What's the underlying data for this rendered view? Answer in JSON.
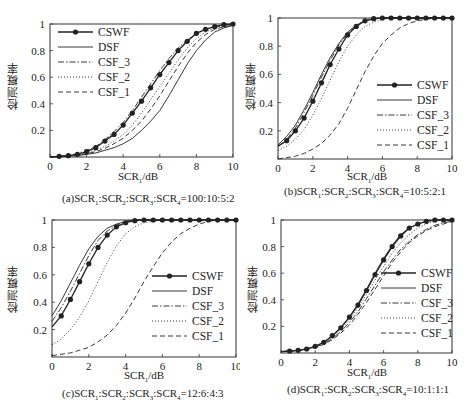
{
  "figure": {
    "ylabel": "检测概率",
    "xlabel_main": "SCR",
    "xlabel_sub": "1",
    "xlabel_unit": "/dB"
  },
  "legend": [
    "CSWF",
    "DSF",
    "CSF_3",
    "CSF_2",
    "CSF_1"
  ],
  "colors": {
    "line": "#222222",
    "axis": "#333333",
    "background": "#ffffff"
  },
  "chart_data": [
    {
      "type": "line",
      "id": "a",
      "caption": "(a)SCR1:SCR2:SCR3:SCR4=100:10:5:2",
      "caption_parts": [
        "(a)SCR",
        "1",
        ":SCR",
        "2",
        ":SCR",
        "3",
        ":SCR",
        "4",
        "=100:10:5:2"
      ],
      "xlabel": "SCR1/dB",
      "ylabel": "检测概率",
      "xlim": [
        0,
        10
      ],
      "ylim": [
        0,
        1
      ],
      "xticks": [
        0,
        2,
        4,
        6,
        8,
        10
      ],
      "yticks": [
        0.2,
        0.4,
        0.6,
        0.8,
        1
      ],
      "legend_position": "upper left",
      "x": [
        0,
        0.5,
        1,
        1.5,
        2,
        2.5,
        3,
        3.5,
        4,
        4.5,
        5,
        5.5,
        6,
        6.5,
        7,
        7.5,
        8,
        8.5,
        9,
        9.5,
        10
      ],
      "series": [
        {
          "name": "CSWF",
          "style": "solid-marker",
          "values": [
            0.0,
            0.005,
            0.01,
            0.02,
            0.04,
            0.07,
            0.12,
            0.17,
            0.24,
            0.33,
            0.42,
            0.52,
            0.62,
            0.71,
            0.8,
            0.87,
            0.93,
            0.96,
            0.98,
            0.995,
            1.0
          ]
        },
        {
          "name": "DSF",
          "style": "solid",
          "values": [
            0.0,
            0.003,
            0.006,
            0.01,
            0.02,
            0.03,
            0.05,
            0.07,
            0.1,
            0.14,
            0.2,
            0.27,
            0.35,
            0.46,
            0.58,
            0.7,
            0.8,
            0.88,
            0.94,
            0.97,
            0.99
          ]
        },
        {
          "name": "CSF_3",
          "style": "dashdot",
          "values": [
            0.0,
            0.006,
            0.012,
            0.025,
            0.05,
            0.08,
            0.13,
            0.19,
            0.26,
            0.35,
            0.45,
            0.55,
            0.65,
            0.74,
            0.82,
            0.88,
            0.93,
            0.96,
            0.98,
            0.99,
            1.0
          ]
        },
        {
          "name": "CSF_2",
          "style": "dotted",
          "values": [
            0.0,
            0.004,
            0.008,
            0.015,
            0.03,
            0.05,
            0.08,
            0.12,
            0.17,
            0.24,
            0.33,
            0.43,
            0.53,
            0.63,
            0.73,
            0.82,
            0.89,
            0.94,
            0.97,
            0.99,
            1.0
          ]
        },
        {
          "name": "CSF_1",
          "style": "dashed",
          "values": [
            0.0,
            0.004,
            0.007,
            0.012,
            0.025,
            0.04,
            0.065,
            0.1,
            0.14,
            0.2,
            0.27,
            0.36,
            0.46,
            0.57,
            0.68,
            0.78,
            0.86,
            0.92,
            0.96,
            0.98,
            0.99
          ]
        }
      ]
    },
    {
      "type": "line",
      "id": "b",
      "caption": "(b)SCR1:SCR2:SCR3:SCR4=10:5:2:1",
      "caption_parts": [
        "(b)SCR",
        "1",
        ":SCR",
        "2",
        ":SCR",
        "3",
        ":SCR",
        "4",
        "=10:5:2:1"
      ],
      "xlabel": "SCR1/dB",
      "ylabel": "检测概率",
      "xlim": [
        0,
        10
      ],
      "ylim": [
        0,
        1
      ],
      "xticks": [
        0,
        2,
        4,
        6,
        8,
        10
      ],
      "yticks": [
        0.2,
        0.4,
        0.6,
        0.8,
        1
      ],
      "legend_position": "lower right",
      "x": [
        0,
        0.5,
        1,
        1.5,
        2,
        2.5,
        3,
        3.5,
        4,
        4.5,
        5,
        5.5,
        6,
        6.5,
        7,
        7.5,
        8,
        8.5,
        9,
        9.5,
        10
      ],
      "series": [
        {
          "name": "CSWF",
          "style": "solid-marker",
          "values": [
            0.09,
            0.13,
            0.2,
            0.29,
            0.41,
            0.54,
            0.67,
            0.78,
            0.88,
            0.94,
            0.98,
            0.995,
            1.0,
            1.0,
            1.0,
            1.0,
            1.0,
            1.0,
            1.0,
            1.0,
            1.0
          ]
        },
        {
          "name": "DSF",
          "style": "solid",
          "values": [
            0.1,
            0.16,
            0.24,
            0.35,
            0.47,
            0.6,
            0.72,
            0.82,
            0.9,
            0.95,
            0.98,
            0.995,
            1.0,
            1.0,
            1.0,
            1.0,
            1.0,
            1.0,
            1.0,
            1.0,
            1.0
          ]
        },
        {
          "name": "CSF_3",
          "style": "dashdot",
          "values": [
            0.09,
            0.14,
            0.22,
            0.33,
            0.45,
            0.58,
            0.7,
            0.81,
            0.89,
            0.95,
            0.98,
            0.99,
            1.0,
            1.0,
            1.0,
            1.0,
            1.0,
            1.0,
            1.0,
            1.0,
            1.0
          ]
        },
        {
          "name": "CSF_2",
          "style": "dotted",
          "values": [
            0.06,
            0.09,
            0.14,
            0.21,
            0.31,
            0.43,
            0.56,
            0.69,
            0.8,
            0.88,
            0.94,
            0.97,
            0.99,
            1.0,
            1.0,
            1.0,
            1.0,
            1.0,
            1.0,
            1.0,
            1.0
          ]
        },
        {
          "name": "CSF_1",
          "style": "dashed",
          "values": [
            0.0,
            0.01,
            0.02,
            0.04,
            0.07,
            0.11,
            0.17,
            0.25,
            0.36,
            0.49,
            0.62,
            0.73,
            0.82,
            0.88,
            0.93,
            0.96,
            0.98,
            0.99,
            1.0,
            1.0,
            1.0
          ]
        }
      ]
    },
    {
      "type": "line",
      "id": "c",
      "caption": "(c)SCR1:SCR2:SCR3:SCR4=12:6:4:3",
      "caption_parts": [
        "(c)SCR",
        "1",
        ":SCR",
        "2",
        ":SCR",
        "3",
        ":SCR",
        "4",
        "=12:6:4:3"
      ],
      "xlabel": "SCR1/dB",
      "ylabel": "检测概率",
      "xlim": [
        0,
        10
      ],
      "ylim": [
        0,
        1
      ],
      "xticks": [
        0,
        2,
        4,
        6,
        8,
        10
      ],
      "yticks": [
        0.2,
        0.4,
        0.6,
        0.8,
        1
      ],
      "legend_position": "lower right",
      "x": [
        0,
        0.5,
        1,
        1.5,
        2,
        2.5,
        3,
        3.5,
        4,
        4.5,
        5,
        5.5,
        6,
        6.5,
        7,
        7.5,
        8,
        8.5,
        9,
        9.5,
        10
      ],
      "series": [
        {
          "name": "CSWF",
          "style": "solid-marker",
          "values": [
            0.22,
            0.3,
            0.42,
            0.55,
            0.68,
            0.8,
            0.89,
            0.95,
            0.98,
            0.995,
            1.0,
            1.0,
            1.0,
            1.0,
            1.0,
            1.0,
            1.0,
            1.0,
            1.0,
            1.0,
            1.0
          ]
        },
        {
          "name": "DSF",
          "style": "solid",
          "values": [
            0.3,
            0.41,
            0.54,
            0.67,
            0.79,
            0.88,
            0.94,
            0.97,
            0.99,
            1.0,
            1.0,
            1.0,
            1.0,
            1.0,
            1.0,
            1.0,
            1.0,
            1.0,
            1.0,
            1.0,
            1.0
          ]
        },
        {
          "name": "CSF_3",
          "style": "dashdot",
          "values": [
            0.26,
            0.36,
            0.48,
            0.61,
            0.74,
            0.85,
            0.92,
            0.96,
            0.99,
            1.0,
            1.0,
            1.0,
            1.0,
            1.0,
            1.0,
            1.0,
            1.0,
            1.0,
            1.0,
            1.0,
            1.0
          ]
        },
        {
          "name": "CSF_2",
          "style": "dotted",
          "values": [
            0.09,
            0.13,
            0.2,
            0.29,
            0.41,
            0.55,
            0.69,
            0.81,
            0.9,
            0.95,
            0.98,
            0.99,
            1.0,
            1.0,
            1.0,
            1.0,
            1.0,
            1.0,
            1.0,
            1.0,
            1.0
          ]
        },
        {
          "name": "CSF_1",
          "style": "dashed",
          "values": [
            0.01,
            0.02,
            0.03,
            0.05,
            0.07,
            0.11,
            0.16,
            0.23,
            0.32,
            0.43,
            0.55,
            0.66,
            0.76,
            0.84,
            0.9,
            0.94,
            0.97,
            0.99,
            1.0,
            1.0,
            1.0
          ]
        }
      ]
    },
    {
      "type": "line",
      "id": "d",
      "caption": "(d)SCR1:SCR2:SCR3:SCR4=10:1:1:1",
      "caption_parts": [
        "(d)SCR",
        "1",
        ":SCR",
        "2",
        ":SCR",
        "3",
        ":SCR",
        "4",
        "=10:1:1:1"
      ],
      "xlabel": "SCR1/dB",
      "ylabel": "检测概率",
      "xlim": [
        0,
        10
      ],
      "ylim": [
        0,
        1
      ],
      "xticks": [
        0,
        2,
        4,
        6,
        8,
        10
      ],
      "yticks": [
        0.2,
        0.4,
        0.6,
        0.8,
        1
      ],
      "legend_position": "lower right",
      "x": [
        0,
        0.5,
        1,
        1.5,
        2,
        2.5,
        3,
        3.5,
        4,
        4.5,
        5,
        5.5,
        6,
        6.5,
        7,
        7.5,
        8,
        8.5,
        9,
        9.5,
        10
      ],
      "series": [
        {
          "name": "CSWF",
          "style": "solid-marker",
          "values": [
            0.01,
            0.015,
            0.02,
            0.03,
            0.05,
            0.08,
            0.13,
            0.19,
            0.27,
            0.36,
            0.47,
            0.59,
            0.7,
            0.8,
            0.88,
            0.94,
            0.97,
            0.99,
            1.0,
            1.0,
            1.0
          ]
        },
        {
          "name": "DSF",
          "style": "solid",
          "values": [
            0.01,
            0.015,
            0.02,
            0.03,
            0.05,
            0.08,
            0.13,
            0.19,
            0.27,
            0.37,
            0.48,
            0.6,
            0.71,
            0.81,
            0.89,
            0.94,
            0.97,
            0.99,
            1.0,
            1.0,
            1.0
          ]
        },
        {
          "name": "CSF_3",
          "style": "dashdot",
          "values": [
            0.01,
            0.014,
            0.02,
            0.03,
            0.045,
            0.07,
            0.11,
            0.16,
            0.23,
            0.31,
            0.41,
            0.51,
            0.61,
            0.7,
            0.78,
            0.84,
            0.89,
            0.93,
            0.96,
            0.98,
            0.99
          ]
        },
        {
          "name": "CSF_2",
          "style": "dotted",
          "values": [
            0.01,
            0.015,
            0.02,
            0.03,
            0.05,
            0.08,
            0.12,
            0.18,
            0.25,
            0.34,
            0.44,
            0.55,
            0.65,
            0.75,
            0.83,
            0.89,
            0.94,
            0.97,
            0.99,
            1.0,
            1.0
          ]
        },
        {
          "name": "CSF_1",
          "style": "dashed",
          "values": [
            0.01,
            0.013,
            0.018,
            0.027,
            0.04,
            0.065,
            0.1,
            0.15,
            0.21,
            0.29,
            0.38,
            0.48,
            0.58,
            0.68,
            0.76,
            0.83,
            0.88,
            0.92,
            0.95,
            0.97,
            0.99
          ]
        }
      ]
    }
  ]
}
